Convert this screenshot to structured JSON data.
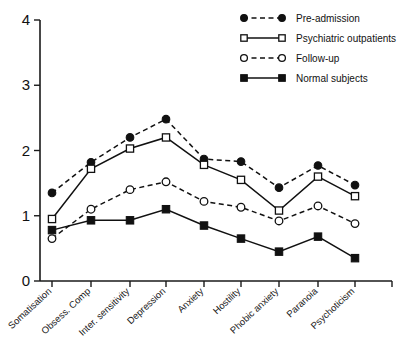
{
  "chart_data": {
    "type": "line",
    "title": "",
    "xlabel": "",
    "ylabel": "",
    "ylim": [
      0,
      4
    ],
    "yticks": [
      "0",
      "1",
      "2",
      "3",
      "4"
    ],
    "grid": false,
    "legend_position": "top-right",
    "categories": [
      "Somatisation",
      "Obsess. Comp",
      "Inter. sensitivity",
      "Depression",
      "Anxiety",
      "Hostility",
      "Phobic anxiety",
      "Paranoia",
      "Psychoticism"
    ],
    "series": [
      {
        "name": "Pre-admission",
        "marker": "filled-circle",
        "linestyle": "dashed",
        "values": [
          1.35,
          1.82,
          2.2,
          2.48,
          1.87,
          1.83,
          1.43,
          1.77,
          1.47
        ]
      },
      {
        "name": "Psychiatric outpatients",
        "marker": "open-square",
        "linestyle": "solid",
        "values": [
          0.95,
          1.72,
          2.03,
          2.2,
          1.78,
          1.55,
          1.08,
          1.6,
          1.3
        ]
      },
      {
        "name": "Follow-up",
        "marker": "open-circle",
        "linestyle": "dashed",
        "values": [
          0.65,
          1.1,
          1.4,
          1.52,
          1.22,
          1.13,
          0.92,
          1.15,
          0.88
        ]
      },
      {
        "name": "Normal subjects",
        "marker": "filled-square",
        "linestyle": "solid",
        "values": [
          0.78,
          0.93,
          0.93,
          1.1,
          0.85,
          0.65,
          0.45,
          0.68,
          0.35
        ]
      }
    ]
  },
  "legend": {
    "items": [
      {
        "label": "Pre-admission"
      },
      {
        "label": "Psychiatric outpatients"
      },
      {
        "label": "Follow-up"
      },
      {
        "label": "Normal subjects"
      }
    ]
  },
  "colors": {
    "ink": "#111111",
    "background": "#ffffff"
  }
}
